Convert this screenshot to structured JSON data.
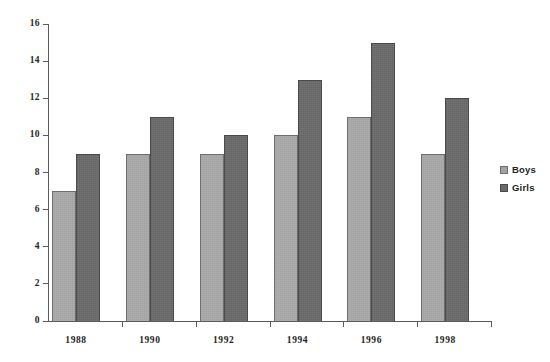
{
  "chart_data": {
    "type": "bar",
    "title": "",
    "subtitle": "",
    "xlabel": "",
    "ylabel": "",
    "categories": [
      "1988",
      "1990",
      "1992",
      "1994",
      "1996",
      "1998"
    ],
    "series": [
      {
        "name": "Boys",
        "color": "#a3a3a3",
        "values": [
          7,
          9,
          9,
          10,
          11,
          9
        ]
      },
      {
        "name": "Girls",
        "color": "#6b6b6b",
        "values": [
          9,
          11,
          10,
          13,
          15,
          12
        ]
      }
    ],
    "ylim": [
      0,
      16
    ],
    "ytick_values": [
      0,
      2,
      4,
      6,
      8,
      10,
      12,
      14,
      16
    ],
    "ytick_labels": [
      "0",
      "2",
      "4",
      "6",
      "8",
      "10",
      "12",
      "14",
      "16"
    ],
    "grid": false,
    "legend_position": "right",
    "legend_entries": [
      "Boys",
      "Girls"
    ],
    "background_color": "#ffffff",
    "axis_color": "#5b5b5b"
  },
  "legend": {
    "items": [
      {
        "label": "Boys",
        "swatch": "legend-swatch-boys"
      },
      {
        "label": "Girls",
        "swatch": "legend-swatch-girls"
      }
    ]
  }
}
